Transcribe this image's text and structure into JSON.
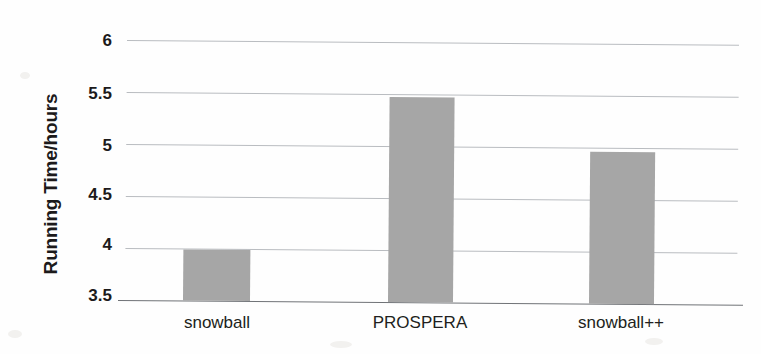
{
  "chart_data": {
    "type": "bar",
    "title": "",
    "xlabel": "",
    "ylabel": "Running Time/hours",
    "categories": [
      "snowball",
      "PROSPERA",
      "snowball++"
    ],
    "values": [
      3.99,
      5.47,
      4.96
    ],
    "series": [
      {
        "name": "Running Time/hours",
        "values": [
          3.99,
          5.47,
          4.96
        ]
      }
    ],
    "ylim": [
      3.5,
      6
    ],
    "ytick_labels": [
      "6",
      "5.5",
      "5",
      "4.5",
      "4",
      "3.5"
    ],
    "ytick_values": [
      6,
      5.5,
      5,
      4.5,
      4,
      3.5
    ],
    "grid": true,
    "legend": false,
    "legend_position": "none",
    "bar_color": "#a6a6a6",
    "gridline_color": "#b9bcc0",
    "axis_color": "#6f7276",
    "background_color": "#ffffff"
  },
  "axis": {
    "y_title": "Running Time/hours"
  }
}
